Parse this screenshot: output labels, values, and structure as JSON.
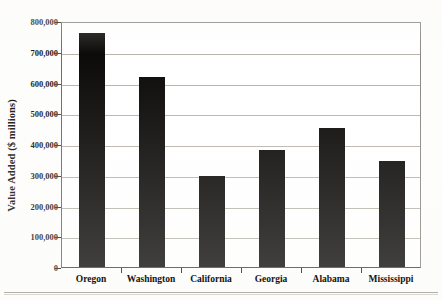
{
  "chart_data": {
    "type": "bar",
    "title": "",
    "subtitle": "",
    "xlabel": "",
    "ylabel": "Value Added ($ millions)",
    "categories": [
      "Oregon",
      "Washington",
      "California",
      "Georgia",
      "Alabama",
      "Mississippi"
    ],
    "values": [
      760000,
      618000,
      296000,
      380000,
      452000,
      345000
    ],
    "ylim": [
      0,
      800000
    ],
    "ytick_values": [
      0,
      100000,
      200000,
      300000,
      400000,
      500000,
      600000,
      700000,
      800000
    ],
    "ytick_labels": [
      "0",
      "100,000",
      "200,000",
      "300,000",
      "400,000",
      "500,000",
      "600,000",
      "700,000",
      "800,000"
    ],
    "grid": true,
    "grid_axis": "y",
    "legend": false,
    "legend_position": "none",
    "bar_color": "#0d0b09",
    "plot_background": "#ffffff",
    "gridline_color": "#b9b5ad",
    "axis_color": "#55514b",
    "annotations": []
  },
  "figure": {
    "name": "value-added-by-state-bar-chart"
  }
}
